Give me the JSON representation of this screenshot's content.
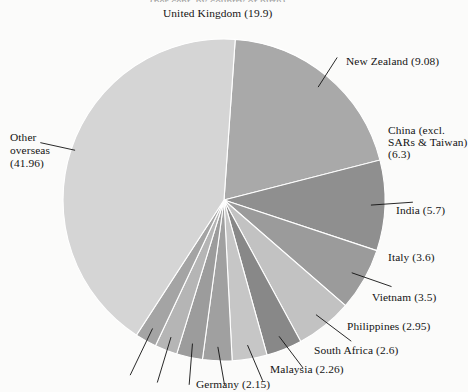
{
  "page": {
    "background_color": "#fbfbfa",
    "truncated_title_fragment": "(per cent, by country of birth)"
  },
  "chart_data": {
    "type": "pie",
    "title": "",
    "units": "per cent",
    "center": {
      "x": 224,
      "y": 200
    },
    "radius": 161,
    "start_angle_deg": -86,
    "direction": "clockwise",
    "categories": [
      "United Kingdom",
      "New Zealand",
      "China (excl. SARs & Taiwan)",
      "India",
      "Italy",
      "Vietnam",
      "Philippines",
      "South Africa",
      "Malaysia",
      "Germany",
      "Other overseas"
    ],
    "values": [
      19.9,
      9.08,
      6.3,
      5.7,
      3.6,
      3.5,
      2.95,
      2.6,
      2.26,
      2.15,
      41.96
    ],
    "colors": [
      "#a9a9a9",
      "#8f8f8f",
      "#9b9b9b",
      "#c2c2c2",
      "#888888",
      "#c6c6c6",
      "#a0a0a0",
      "#9c9c9c",
      "#b5b5b5",
      "#a4a4a4",
      "#d5d5d5"
    ],
    "slice_border_color": "#ffffff",
    "legend": "none",
    "grid": false,
    "labels_style": "callout-with-leader-line"
  },
  "labels": {
    "united_kingdom": {
      "text": "United Kingdom (19.9)",
      "left": 163,
      "top": 7
    },
    "new_zealand": {
      "text": "New Zealand (9.08)",
      "left": 346,
      "top": 55
    },
    "china_line1": {
      "text": "China (excl.",
      "left": 388,
      "top": 124
    },
    "china_line2": {
      "text": "SARs & Taiwan)",
      "left": 388,
      "top": 136
    },
    "china_line3": {
      "text": "(6.3)",
      "left": 388,
      "top": 148
    },
    "india": {
      "text": "India (5.7)",
      "left": 396,
      "top": 204
    },
    "italy": {
      "text": "Italy (3.6)",
      "left": 388,
      "top": 251
    },
    "vietnam": {
      "text": "Vietnam (3.5)",
      "left": 372,
      "top": 291
    },
    "philippines": {
      "text": "Philippines (2.95)",
      "left": 347,
      "top": 320
    },
    "south_africa": {
      "text": "South Africa (2.6)",
      "left": 314,
      "top": 344
    },
    "malaysia": {
      "text": "Malaysia (2.26)",
      "left": 270,
      "top": 363
    },
    "germany": {
      "text": "Germany (2.15)",
      "left": 196,
      "top": 378
    },
    "other_line1": {
      "text": "Other",
      "left": 10,
      "top": 131
    },
    "other_line2": {
      "text": "overseas",
      "left": 10,
      "top": 144
    },
    "other_line3": {
      "text": "(41.96)",
      "left": 10,
      "top": 157
    }
  },
  "bleed_through_text": [
    {
      "text": "OCEANIA",
      "left": 150,
      "top": 262,
      "size": 15
    }
  ]
}
